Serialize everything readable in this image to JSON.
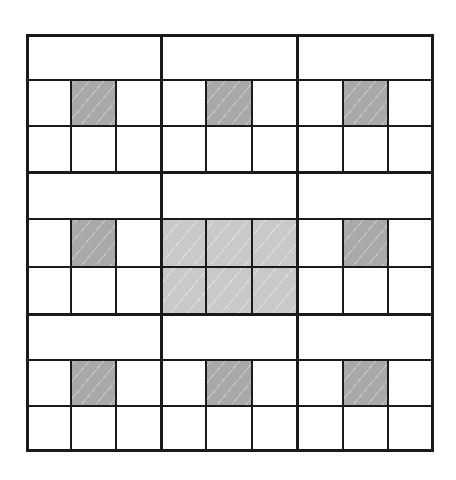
{
  "diagram": {
    "title": "",
    "blocks_rows": 3,
    "blocks_cols": 3,
    "colors": {
      "line": "#1a1a1a",
      "dark_shade": "#a9a9a9",
      "light_shade": "#c9c9c9",
      "background": "#ffffff"
    },
    "blocks": [
      {
        "row": 0,
        "col": 0,
        "fill": "corner-mark"
      },
      {
        "row": 0,
        "col": 1,
        "fill": "corner-mark"
      },
      {
        "row": 0,
        "col": 2,
        "fill": "corner-mark"
      },
      {
        "row": 1,
        "col": 0,
        "fill": "corner-mark"
      },
      {
        "row": 1,
        "col": 1,
        "fill": "center-full"
      },
      {
        "row": 1,
        "col": 2,
        "fill": "corner-mark"
      },
      {
        "row": 2,
        "col": 0,
        "fill": "corner-mark"
      },
      {
        "row": 2,
        "col": 1,
        "fill": "corner-mark"
      },
      {
        "row": 2,
        "col": 2,
        "fill": "corner-mark"
      }
    ]
  }
}
